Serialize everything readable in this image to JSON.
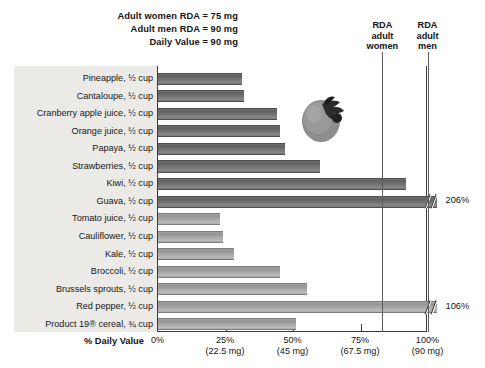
{
  "header": {
    "notes": [
      "Adult women RDA = 75 mg",
      "Adult men RDA = 90 mg",
      "Daily Value = 90 mg"
    ]
  },
  "reference_lines": [
    {
      "name": "rda-adult-women",
      "percent": 83.3,
      "caption_line1": "RDA",
      "caption_line2": "adult",
      "caption_line3": "women"
    },
    {
      "name": "rda-adult-men",
      "percent": 100,
      "caption_line1": "RDA",
      "caption_line2": "adult",
      "caption_line3": "men"
    }
  ],
  "axis": {
    "title": "% Daily Value",
    "ticks": [
      {
        "percent": "0%",
        "mg": ""
      },
      {
        "percent": "25%",
        "mg": "(22.5 mg)"
      },
      {
        "percent": "50%",
        "mg": "(45 mg)"
      },
      {
        "percent": "75%",
        "mg": "(67.5 mg)"
      },
      {
        "percent": "100%",
        "mg": "(90 mg)"
      }
    ]
  },
  "illustration": {
    "name": "strawberry-illustration"
  },
  "chart_data": {
    "type": "bar",
    "orientation": "horizontal",
    "title": "",
    "xlabel": "% Daily Value",
    "ylabel": "",
    "xlim": [
      0,
      100
    ],
    "grid": false,
    "categories": [
      "Pineapple, ½ cup",
      "Cantaloupe, ½ cup",
      "Cranberry apple juice, ½ cup",
      "Orange juice, ½ cup",
      "Papaya, ½ cup",
      "Strawberries, ½ cup",
      "Kiwi, ½ cup",
      "Guava, ½ cup",
      "Tomato juice, ½ cup",
      "Cauliflower, ½ cup",
      "Kale, ½ cup",
      "Broccoli, ½ cup",
      "Brussels sprouts, ½ cup",
      "Red pepper, ½ cup",
      "Product 19® cereal, ¾ cup"
    ],
    "values": [
      31,
      32,
      44,
      45,
      47,
      60,
      92,
      206,
      23,
      24,
      28,
      45,
      55,
      106,
      51
    ],
    "bars": [
      {
        "label": "Pineapple, ½ cup",
        "value": 31,
        "shade": "dark",
        "truncated": false,
        "value_label": ""
      },
      {
        "label": "Cantaloupe, ½ cup",
        "value": 32,
        "shade": "dark",
        "truncated": false,
        "value_label": ""
      },
      {
        "label": "Cranberry apple juice, ½ cup",
        "value": 44,
        "shade": "dark",
        "truncated": false,
        "value_label": ""
      },
      {
        "label": "Orange juice, ½ cup",
        "value": 45,
        "shade": "dark",
        "truncated": false,
        "value_label": ""
      },
      {
        "label": "Papaya, ½ cup",
        "value": 47,
        "shade": "dark",
        "truncated": false,
        "value_label": ""
      },
      {
        "label": "Strawberries, ½ cup",
        "value": 60,
        "shade": "dark",
        "truncated": false,
        "value_label": ""
      },
      {
        "label": "Kiwi, ½ cup",
        "value": 92,
        "shade": "dark",
        "truncated": false,
        "value_label": ""
      },
      {
        "label": "Guava, ½ cup",
        "value": 206,
        "shade": "dark",
        "truncated": true,
        "value_label": "206%"
      },
      {
        "label": "Tomato juice, ½ cup",
        "value": 23,
        "shade": "light",
        "truncated": false,
        "value_label": ""
      },
      {
        "label": "Cauliflower, ½ cup",
        "value": 24,
        "shade": "light",
        "truncated": false,
        "value_label": ""
      },
      {
        "label": "Kale, ½ cup",
        "value": 28,
        "shade": "light",
        "truncated": false,
        "value_label": ""
      },
      {
        "label": "Broccoli, ½ cup",
        "value": 45,
        "shade": "light",
        "truncated": false,
        "value_label": ""
      },
      {
        "label": "Brussels sprouts, ½ cup",
        "value": 55,
        "shade": "light",
        "truncated": false,
        "value_label": ""
      },
      {
        "label": "Red pepper, ½ cup",
        "value": 106,
        "shade": "light",
        "truncated": true,
        "value_label": "106%"
      },
      {
        "label": "Product 19® cereal, ¾ cup",
        "value": 51,
        "shade": "light",
        "truncated": false,
        "value_label": ""
      }
    ],
    "annotations": [
      "Adult women RDA = 75 mg",
      "Adult men RDA = 90 mg",
      "Daily Value = 90 mg",
      "RDA adult women",
      "RDA adult men"
    ],
    "colors": {
      "bar_dark": "#747474",
      "bar_light": "#a9a9a9",
      "panel": "#eceae7",
      "axis": "#3a3a3a"
    }
  }
}
